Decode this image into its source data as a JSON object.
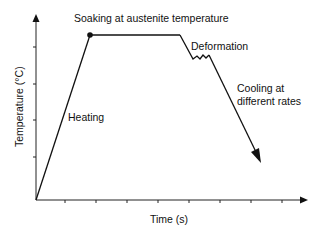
{
  "diagram": {
    "type": "thermomechanical-process-schematic",
    "axes": {
      "xlabel": "Time (s)",
      "ylabel": "Temperature (°C)",
      "x_ticks": 8,
      "y_ticks": 4
    },
    "annotations": {
      "soaking": "Soaking at austenite temperature",
      "heating": "Heating",
      "deformation": "Deformation",
      "cooling_line1": "Cooling at",
      "cooling_line2": "different rates"
    },
    "stages": [
      "Heating",
      "Soaking at austenite temperature",
      "Deformation",
      "Cooling at different rates"
    ],
    "colors": {
      "line": "#111111",
      "background": "#ffffff"
    }
  }
}
